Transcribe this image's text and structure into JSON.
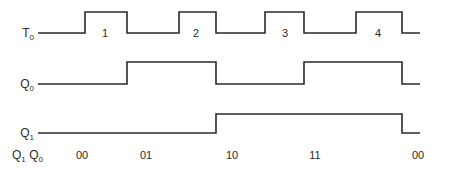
{
  "diagram": {
    "signals": [
      {
        "id": "T0",
        "label": "T",
        "subscript": "0",
        "label_x": 20,
        "low_y": 33,
        "high_y": 12,
        "start_x": 38,
        "end_x": 420,
        "initial": 0,
        "edges": [
          85,
          127,
          179,
          216,
          265,
          304,
          356,
          402
        ],
        "pulse_labels": [
          {
            "text": "1",
            "x": 105,
            "y": 37
          },
          {
            "text": "2",
            "x": 196,
            "y": 37
          },
          {
            "text": "3",
            "x": 285,
            "y": 37
          },
          {
            "text": "4",
            "x": 378,
            "y": 37
          }
        ]
      },
      {
        "id": "Q0",
        "label": "Q",
        "subscript": "0",
        "label_x": 20,
        "low_y": 84,
        "high_y": 62,
        "start_x": 38,
        "end_x": 420,
        "initial": 0,
        "edges": [
          127,
          216,
          304,
          402
        ],
        "pulse_labels": []
      },
      {
        "id": "Q1",
        "label": "Q",
        "subscript": "1",
        "label_x": 20,
        "low_y": 133,
        "high_y": 114,
        "start_x": 38,
        "end_x": 420,
        "initial": 0,
        "edges": [
          216,
          402
        ],
        "pulse_labels": []
      }
    ],
    "state_row": {
      "header": {
        "q": "Q",
        "s1": "1",
        "sep": " ",
        "q2": "Q",
        "s2": "0",
        "x": 12,
        "y": 159
      },
      "states": [
        {
          "text": "00",
          "x": 82,
          "y": 159
        },
        {
          "text": "01",
          "x": 146,
          "y": 159
        },
        {
          "text": "10",
          "x": 232,
          "y": 159
        },
        {
          "text": "11",
          "x": 315,
          "y": 159
        },
        {
          "text": "00",
          "x": 418,
          "y": 159
        }
      ]
    },
    "colors": {
      "stroke": "#2a2a2a",
      "background": "#ffffff"
    }
  }
}
